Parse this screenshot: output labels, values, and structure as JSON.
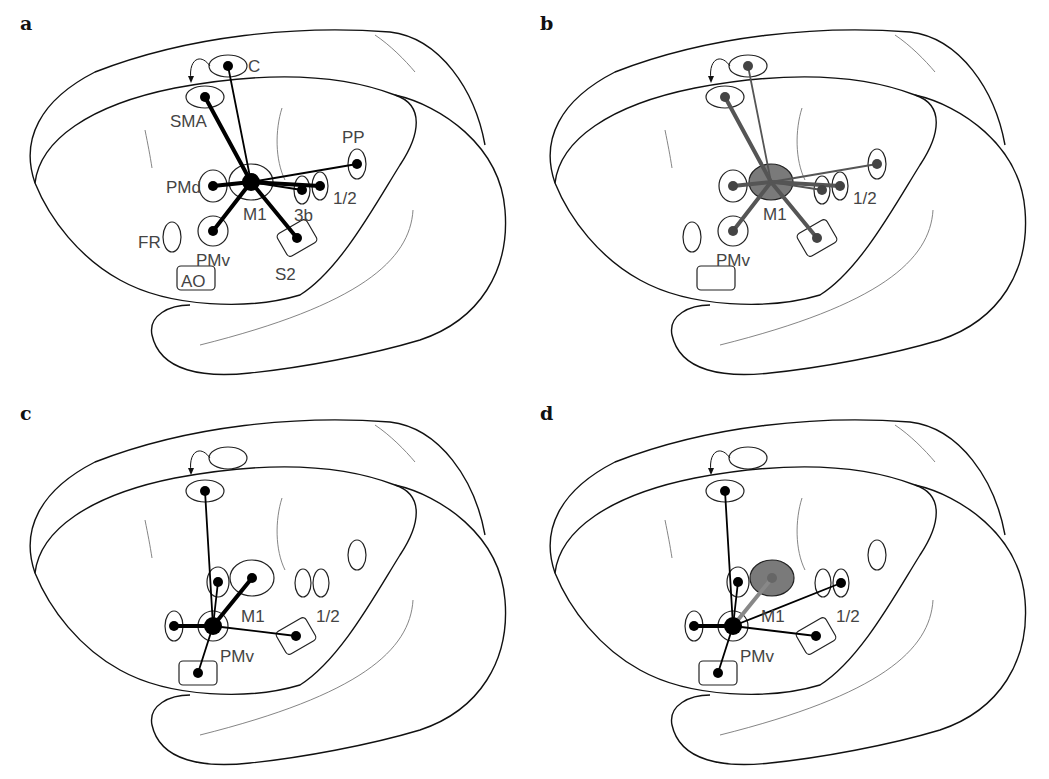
{
  "figure": {
    "panels": [
      {
        "id": "a",
        "letter": "a",
        "hub": "M1",
        "hub_style": "outline",
        "line_color": "#000000",
        "areas": [
          {
            "id": "C",
            "label": "C",
            "shape": "ellipse",
            "dot": true
          },
          {
            "id": "SMA",
            "label": "SMA",
            "shape": "ellipse",
            "dot": true
          },
          {
            "id": "M1",
            "label": "M1",
            "shape": "ellipse",
            "dot": true
          },
          {
            "id": "PMd",
            "label": "PMd",
            "shape": "ellipse",
            "dot": true
          },
          {
            "id": "3b",
            "label": "3b",
            "shape": "ellipse",
            "dot": true
          },
          {
            "id": "1/2",
            "label": "1/2",
            "shape": "ellipse",
            "dot": true
          },
          {
            "id": "PP",
            "label": "PP",
            "shape": "ellipse",
            "dot": true
          },
          {
            "id": "PMv",
            "label": "PMv",
            "shape": "ellipse",
            "dot": true
          },
          {
            "id": "S2",
            "label": "S2",
            "shape": "rect",
            "dot": true
          },
          {
            "id": "FR",
            "label": "FR",
            "shape": "ellipse",
            "dot": false
          },
          {
            "id": "AO",
            "label": "AO",
            "shape": "rect",
            "dot": false
          }
        ],
        "connections": [
          {
            "from": "M1",
            "to": "C",
            "strength": "weak"
          },
          {
            "from": "M1",
            "to": "SMA",
            "strength": "strong"
          },
          {
            "from": "M1",
            "to": "PMd",
            "strength": "strong"
          },
          {
            "from": "M1",
            "to": "PMv",
            "strength": "strong"
          },
          {
            "from": "M1",
            "to": "S2",
            "strength": "strong"
          },
          {
            "from": "M1",
            "to": "3b",
            "strength": "weak"
          },
          {
            "from": "M1",
            "to": "1/2",
            "strength": "strong"
          },
          {
            "from": "M1",
            "to": "PP",
            "strength": "weak"
          }
        ]
      },
      {
        "id": "b",
        "letter": "b",
        "hub": "M1",
        "hub_style": "filled-gray",
        "line_color": "#555555",
        "areas": [
          {
            "id": "C",
            "label": "",
            "shape": "ellipse",
            "dot": true
          },
          {
            "id": "SMA",
            "label": "",
            "shape": "ellipse",
            "dot": true
          },
          {
            "id": "M1",
            "label": "M1",
            "shape": "ellipse",
            "dot": true
          },
          {
            "id": "PMd",
            "label": "",
            "shape": "ellipse",
            "dot": true
          },
          {
            "id": "3b",
            "label": "",
            "shape": "ellipse",
            "dot": true
          },
          {
            "id": "1/2",
            "label": "1/2",
            "shape": "ellipse",
            "dot": true
          },
          {
            "id": "PP",
            "label": "",
            "shape": "ellipse",
            "dot": true
          },
          {
            "id": "PMv",
            "label": "PMv",
            "shape": "ellipse",
            "dot": true
          },
          {
            "id": "S2",
            "label": "",
            "shape": "rect",
            "dot": true
          },
          {
            "id": "FR",
            "label": "",
            "shape": "ellipse",
            "dot": false
          },
          {
            "id": "AO",
            "label": "",
            "shape": "rect",
            "dot": false
          }
        ],
        "connections": [
          {
            "from": "M1",
            "to": "C",
            "strength": "weak"
          },
          {
            "from": "M1",
            "to": "SMA",
            "strength": "strong"
          },
          {
            "from": "M1",
            "to": "PMd",
            "strength": "strong"
          },
          {
            "from": "M1",
            "to": "PMv",
            "strength": "strong"
          },
          {
            "from": "M1",
            "to": "S2",
            "strength": "strong"
          },
          {
            "from": "M1",
            "to": "3b",
            "strength": "weak"
          },
          {
            "from": "M1",
            "to": "1/2",
            "strength": "strong"
          },
          {
            "from": "M1",
            "to": "PP",
            "strength": "weak"
          }
        ]
      },
      {
        "id": "c",
        "letter": "c",
        "hub": "PMv",
        "hub_style": "outline",
        "line_color": "#000000",
        "areas": [
          {
            "id": "C",
            "label": "",
            "shape": "ellipse",
            "dot": false
          },
          {
            "id": "SMA",
            "label": "",
            "shape": "ellipse",
            "dot": true
          },
          {
            "id": "PMd",
            "label": "",
            "shape": "ellipse",
            "dot": true
          },
          {
            "id": "M1",
            "label": "M1",
            "shape": "ellipse",
            "dot": true
          },
          {
            "id": "3b",
            "label": "",
            "shape": "ellipse",
            "dot": false
          },
          {
            "id": "1/2",
            "label": "1/2",
            "shape": "ellipse",
            "dot": false
          },
          {
            "id": "PP",
            "label": "",
            "shape": "ellipse",
            "dot": false
          },
          {
            "id": "FR",
            "label": "",
            "shape": "ellipse",
            "dot": true
          },
          {
            "id": "PMv",
            "label": "PMv",
            "shape": "ellipse",
            "dot": true
          },
          {
            "id": "S2",
            "label": "",
            "shape": "rect",
            "dot": true
          },
          {
            "id": "AO",
            "label": "",
            "shape": "rect",
            "dot": true
          }
        ],
        "connections": [
          {
            "from": "PMv",
            "to": "SMA",
            "strength": "weak"
          },
          {
            "from": "PMv",
            "to": "PMd",
            "strength": "weak"
          },
          {
            "from": "PMv",
            "to": "M1",
            "strength": "strong"
          },
          {
            "from": "PMv",
            "to": "FR",
            "strength": "strong"
          },
          {
            "from": "PMv",
            "to": "S2",
            "strength": "weak"
          },
          {
            "from": "PMv",
            "to": "AO",
            "strength": "weak"
          }
        ]
      },
      {
        "id": "d",
        "letter": "d",
        "hub": "PMv",
        "hub_style": "outline",
        "line_color": "#000000",
        "highlight_area": "M1",
        "areas": [
          {
            "id": "C",
            "label": "",
            "shape": "ellipse",
            "dot": false
          },
          {
            "id": "SMA",
            "label": "",
            "shape": "ellipse",
            "dot": true
          },
          {
            "id": "PMd",
            "label": "",
            "shape": "ellipse",
            "dot": true
          },
          {
            "id": "M1",
            "label": "M1",
            "shape": "ellipse",
            "dot": true
          },
          {
            "id": "3b",
            "label": "",
            "shape": "ellipse",
            "dot": false
          },
          {
            "id": "1/2",
            "label": "1/2",
            "shape": "ellipse",
            "dot": true
          },
          {
            "id": "PP",
            "label": "",
            "shape": "ellipse",
            "dot": false
          },
          {
            "id": "FR",
            "label": "",
            "shape": "ellipse",
            "dot": true
          },
          {
            "id": "PMv",
            "label": "PMv",
            "shape": "ellipse",
            "dot": true
          },
          {
            "id": "S2",
            "label": "",
            "shape": "rect",
            "dot": true
          },
          {
            "id": "AO",
            "label": "",
            "shape": "rect",
            "dot": true
          }
        ],
        "connections": [
          {
            "from": "PMv",
            "to": "SMA",
            "strength": "weak"
          },
          {
            "from": "PMv",
            "to": "PMd",
            "strength": "weak"
          },
          {
            "from": "PMv",
            "to": "M1",
            "strength": "strong",
            "color": "#888888"
          },
          {
            "from": "PMv",
            "to": "1/2",
            "strength": "weak"
          },
          {
            "from": "PMv",
            "to": "FR",
            "strength": "strong"
          },
          {
            "from": "PMv",
            "to": "S2",
            "strength": "weak"
          },
          {
            "from": "PMv",
            "to": "AO",
            "strength": "weak"
          }
        ]
      }
    ]
  }
}
